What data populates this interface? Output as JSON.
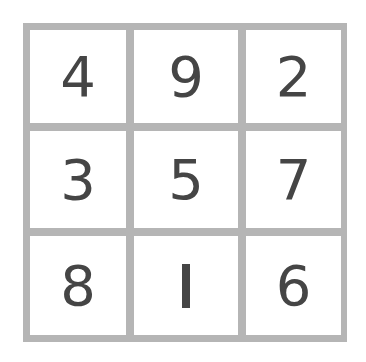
{
  "grid": {
    "border_color": "#b5b5b5",
    "digit_color": "#454545",
    "rows": [
      [
        "4",
        "9",
        "2"
      ],
      [
        "3",
        "5",
        "7"
      ],
      [
        "8",
        "1",
        "6"
      ]
    ]
  }
}
